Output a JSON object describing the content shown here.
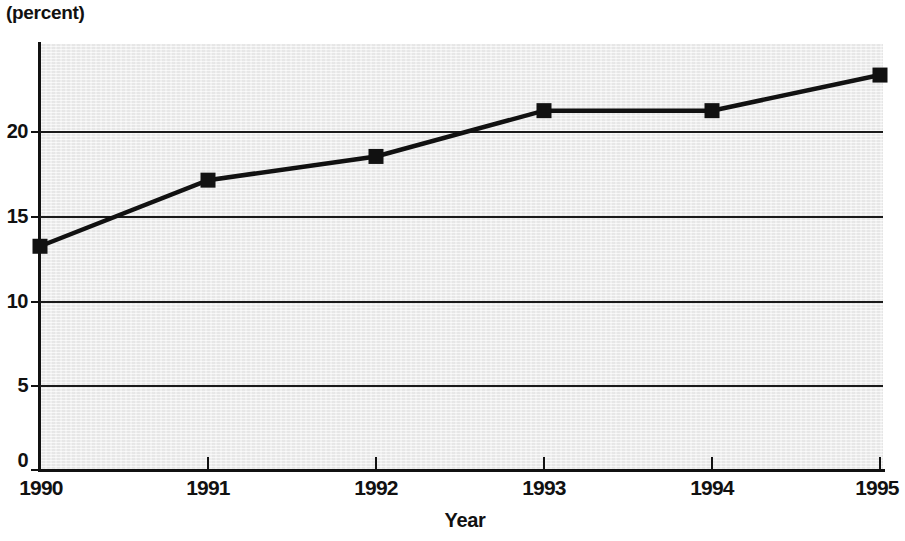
{
  "chart_data": {
    "type": "line",
    "title": "",
    "unit_label": "(percent)",
    "xlabel": "Year",
    "ylabel": "",
    "categories": [
      "1990",
      "1991",
      "1992",
      "1993",
      "1994",
      "1995"
    ],
    "x": [
      1990,
      1991,
      1992,
      1993,
      1994,
      1995
    ],
    "values": [
      13.2,
      17.1,
      18.5,
      21.2,
      21.2,
      23.3
    ],
    "series": [
      {
        "name": "percent",
        "values": [
          13.2,
          17.1,
          18.5,
          21.2,
          21.2,
          23.3
        ]
      }
    ],
    "xlim": [
      1990,
      1995
    ],
    "ylim": [
      0,
      25
    ],
    "yticks": [
      "0",
      "5",
      "10",
      "15",
      "20"
    ],
    "ytick_values": [
      0,
      5,
      10,
      15,
      20
    ],
    "xticks": [
      "1990",
      "1991",
      "1992",
      "1993",
      "1994",
      "1995"
    ],
    "grid": "horizontal",
    "legend": "none",
    "marker": "filled-square",
    "line_color": "#111111",
    "marker_color": "#111111",
    "plot_background": "#eeeeee",
    "page_background": "#ffffff"
  }
}
